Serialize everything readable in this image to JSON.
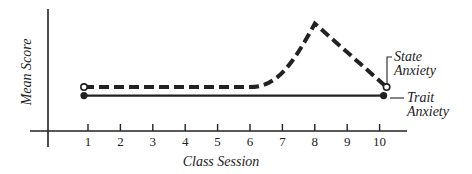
{
  "chart_data": {
    "type": "line",
    "title": "",
    "xlabel": "Class Session",
    "ylabel": "Mean Score",
    "x": [
      1,
      2,
      3,
      4,
      5,
      6,
      7,
      8,
      9,
      10
    ],
    "categories": [
      "1",
      "2",
      "3",
      "4",
      "5",
      "6",
      "7",
      "8",
      "9",
      "10"
    ],
    "series": [
      {
        "name": "State Anxiety",
        "style": "dashed",
        "marker": "open-circle-endpoints",
        "values": [
          36,
          36,
          36,
          36,
          36,
          36,
          55,
          88,
          63,
          36
        ]
      },
      {
        "name": "Trait Anxiety",
        "style": "solid",
        "marker": "filled-circle-endpoints",
        "values": [
          29,
          29,
          29,
          29,
          29,
          29,
          29,
          29,
          29,
          29
        ]
      }
    ],
    "ylim": [
      0,
      100
    ],
    "y_ticks_shown": false,
    "grid": false,
    "legend_position": "inline-right",
    "annotations": [
      {
        "text": "State Anxiety",
        "target": "State Anxiety endpoint at session 10"
      },
      {
        "text": "Trait Anxiety",
        "target": "Trait Anxiety endpoint at session 10"
      }
    ]
  },
  "labels": {
    "y_axis": "Mean Score",
    "x_axis": "Class Session",
    "state_line1": "State",
    "state_line2": "Anxiety",
    "trait_line1": "Trait",
    "trait_line2": "Anxiety"
  },
  "ticks": [
    "1",
    "2",
    "3",
    "4",
    "5",
    "6",
    "7",
    "8",
    "9",
    "10"
  ],
  "colors": {
    "ink": "#222222",
    "background": "#ffffff"
  }
}
